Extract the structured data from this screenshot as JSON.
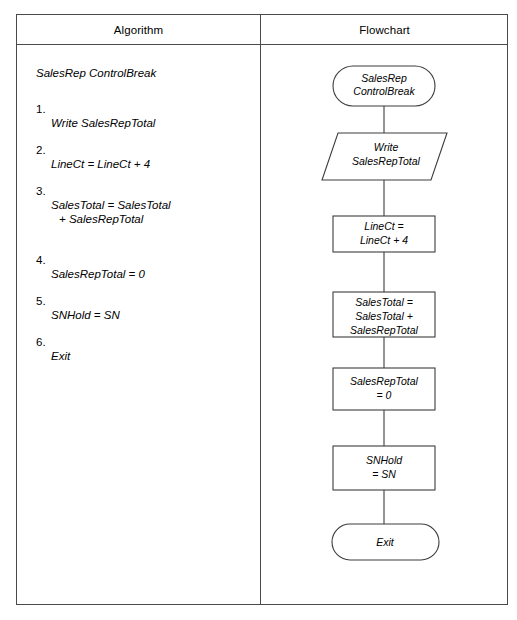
{
  "table": {
    "headers": {
      "algorithm": "Algorithm",
      "flowchart": "Flowchart"
    }
  },
  "algorithm": {
    "title": "SalesRep ControlBreak",
    "steps": [
      {
        "num": "1.",
        "text": "Write SalesRepTotal",
        "cont": ""
      },
      {
        "num": "2.",
        "text": "LineCt = LineCt + 4",
        "cont": ""
      },
      {
        "num": "3.",
        "text": "SalesTotal = SalesTotal",
        "cont": "+ SalesRepTotal"
      },
      {
        "num": "4.",
        "text": "SalesRepTotal = 0",
        "cont": ""
      },
      {
        "num": "5.",
        "text": "SNHold = SN",
        "cont": ""
      },
      {
        "num": "6.",
        "text": "Exit",
        "cont": ""
      }
    ]
  },
  "flowchart": {
    "nodes": [
      {
        "id": "start-terminator",
        "shape": "terminator",
        "lines": [
          "SalesRep",
          "ControlBreak"
        ]
      },
      {
        "id": "write-io",
        "shape": "parallelogram",
        "lines": [
          "Write",
          "SalesRepTotal"
        ]
      },
      {
        "id": "linect-process",
        "shape": "rectangle",
        "lines": [
          "LineCt =",
          "LineCt + 4"
        ]
      },
      {
        "id": "salestotal-process",
        "shape": "rectangle",
        "lines": [
          "SalesTotal =",
          "SalesTotal +",
          "SalesRepTotal"
        ]
      },
      {
        "id": "salesreptotal-process",
        "shape": "rectangle",
        "lines": [
          "SalesRepTotal",
          "= 0"
        ]
      },
      {
        "id": "snhold-process",
        "shape": "rectangle",
        "lines": [
          "SNHold",
          "= SN"
        ]
      },
      {
        "id": "exit-terminator",
        "shape": "terminator",
        "lines": [
          "Exit"
        ]
      }
    ]
  },
  "colors": {
    "stroke": "#3c3c3c",
    "frame": "#4a4a4a",
    "text": "#000000",
    "background": "#ffffff"
  }
}
